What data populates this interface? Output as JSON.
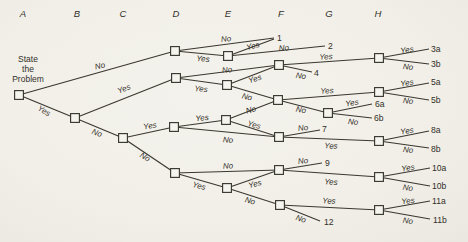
{
  "meta": {
    "bg": "#f1efe9",
    "ink": "#3a372f",
    "text_color": "#322f28",
    "node_fill": "#f6f4ee",
    "line_width": 1.15,
    "node_size": 8.8
  },
  "headers": {
    "y": 13,
    "items": [
      {
        "t": "A",
        "x": 23
      },
      {
        "t": "B",
        "x": 77
      },
      {
        "t": "C",
        "x": 123
      },
      {
        "t": "D",
        "x": 176
      },
      {
        "t": "E",
        "x": 228
      },
      {
        "t": "F",
        "x": 281
      },
      {
        "t": "G",
        "x": 329
      },
      {
        "t": "H",
        "x": 378
      }
    ]
  },
  "problem": {
    "lines": [
      "State",
      "the",
      "Problem"
    ],
    "x": 28,
    "y": 58.5,
    "lh": 10.3
  },
  "nodes": [
    {
      "id": "A",
      "x": 19,
      "y": 95
    },
    {
      "id": "B",
      "x": 75,
      "y": 118
    },
    {
      "id": "C",
      "x": 123,
      "y": 138
    },
    {
      "id": "D1",
      "x": 175,
      "y": 51
    },
    {
      "id": "D2",
      "x": 176,
      "y": 78
    },
    {
      "id": "D4",
      "x": 174,
      "y": 127
    },
    {
      "id": "D5",
      "x": 175,
      "y": 173
    },
    {
      "id": "E1",
      "x": 228,
      "y": 56
    },
    {
      "id": "E2",
      "x": 227,
      "y": 85
    },
    {
      "id": "E4",
      "x": 226,
      "y": 120
    },
    {
      "id": "E5",
      "x": 227,
      "y": 188
    },
    {
      "id": "F3",
      "x": 279,
      "y": 65
    },
    {
      "id": "F6",
      "x": 278,
      "y": 100
    },
    {
      "id": "F7",
      "x": 279,
      "y": 137
    },
    {
      "id": "F9",
      "x": 279,
      "y": 170
    },
    {
      "id": "F11",
      "x": 280,
      "y": 205
    },
    {
      "id": "G6",
      "x": 328,
      "y": 113
    },
    {
      "id": "H3",
      "x": 379,
      "y": 58
    },
    {
      "id": "H5",
      "x": 379,
      "y": 92
    },
    {
      "id": "H8",
      "x": 379,
      "y": 141
    },
    {
      "id": "H10",
      "x": 379,
      "y": 177
    },
    {
      "id": "H11",
      "x": 379,
      "y": 210
    }
  ],
  "edges": [
    {
      "from": "A",
      "to": "D1",
      "label": "No",
      "lx": 100,
      "ly": 66,
      "rot": -13
    },
    {
      "from": "A",
      "to": "B",
      "label": "Yes",
      "lx": 44,
      "ly": 111,
      "rot": 30
    },
    {
      "from": "B",
      "to": "D2",
      "label": "Yes",
      "lx": 124,
      "ly": 89,
      "rot": -22
    },
    {
      "from": "B",
      "to": "C",
      "label": "No",
      "lx": 97,
      "ly": 133,
      "rot": 22
    },
    {
      "from": "C",
      "to": "D4",
      "label": "Yes",
      "lx": 150,
      "ly": 126,
      "rot": -10
    },
    {
      "from": "C",
      "to": "D5",
      "label": "No",
      "lx": 145,
      "ly": 157,
      "rot": 32
    },
    {
      "from": "D1",
      "pt": [
        274,
        38
      ],
      "label": "No",
      "lx": 226,
      "ly": 39,
      "rot": -6
    },
    {
      "from": "D1",
      "to": "E1",
      "label": "Yes",
      "lx": 203,
      "ly": 59,
      "rot": 4
    },
    {
      "from": "E1",
      "pt": [
        274,
        39
      ],
      "label": "Yes",
      "lx": 253,
      "ly": 46,
      "rot": -16
    },
    {
      "from": "E1",
      "pt": [
        325,
        46
      ],
      "label": "No",
      "lx": 284,
      "ly": 48,
      "rot": -5
    },
    {
      "from": "D2",
      "to": "F3",
      "label": "No",
      "lx": 227,
      "ly": 70,
      "rot": -6
    },
    {
      "from": "D2",
      "to": "E2",
      "label": "Yes",
      "lx": 201,
      "ly": 89,
      "rot": 5
    },
    {
      "from": "E2",
      "to": "F3",
      "label": "Yes",
      "lx": 255,
      "ly": 79,
      "rot": -17
    },
    {
      "from": "E2",
      "to": "F6",
      "label": "No",
      "lx": 247,
      "ly": 97,
      "rot": 14
    },
    {
      "from": "F3",
      "to": "H3",
      "label": "Yes",
      "lx": 326,
      "ly": 57,
      "rot": -3
    },
    {
      "from": "F3",
      "pt": [
        312,
        72
      ],
      "label": "No",
      "lx": 301,
      "ly": 76,
      "rot": 9
    },
    {
      "from": "H3",
      "pt": [
        429,
        49
      ],
      "label": "Yes",
      "lx": 407,
      "ly": 50,
      "rot": -8
    },
    {
      "from": "H3",
      "pt": [
        429,
        64
      ],
      "label": "No",
      "lx": 408,
      "ly": 67,
      "rot": 5
    },
    {
      "from": "E4",
      "to": "F6",
      "label": "No",
      "lx": 251,
      "ly": 110,
      "rot": -16
    },
    {
      "from": "F6",
      "to": "H5",
      "label": "Yes",
      "lx": 327,
      "ly": 91,
      "rot": -3
    },
    {
      "from": "F6",
      "to": "G6",
      "label": "No",
      "lx": 301,
      "ly": 110,
      "rot": 10
    },
    {
      "from": "G6",
      "pt": [
        372,
        104
      ],
      "label": "Yes",
      "lx": 352,
      "ly": 103,
      "rot": -8
    },
    {
      "from": "G6",
      "pt": [
        372,
        118
      ],
      "label": "No",
      "lx": 353,
      "ly": 122,
      "rot": 6
    },
    {
      "from": "H5",
      "pt": [
        429,
        83
      ],
      "label": "Yes",
      "lx": 407,
      "ly": 83,
      "rot": -8
    },
    {
      "from": "H5",
      "pt": [
        429,
        100
      ],
      "label": "No",
      "lx": 408,
      "ly": 101,
      "rot": 6
    },
    {
      "from": "D4",
      "to": "E4",
      "label": "Yes",
      "lx": 202,
      "ly": 118,
      "rot": -6
    },
    {
      "from": "D4",
      "to": "F7",
      "label": "No",
      "lx": 228,
      "ly": 140,
      "rot": 4
    },
    {
      "from": "E4",
      "to": "F7",
      "label": "Yes",
      "lx": 254,
      "ly": 125,
      "rot": 14
    },
    {
      "from": "F7",
      "pt": [
        320,
        130
      ],
      "label": "No",
      "lx": 303,
      "ly": 128,
      "rot": -7
    },
    {
      "from": "F7",
      "to": "H8",
      "label": "Yes",
      "lx": 331,
      "ly": 146,
      "rot": 2
    },
    {
      "from": "H8",
      "pt": [
        429,
        131
      ],
      "label": "Yes",
      "lx": 407,
      "ly": 131,
      "rot": -9
    },
    {
      "from": "H8",
      "pt": [
        429,
        148
      ],
      "label": "No",
      "lx": 408,
      "ly": 150,
      "rot": 6
    },
    {
      "from": "D5",
      "to": "F9",
      "label": "No",
      "lx": 228,
      "ly": 166,
      "rot": -2
    },
    {
      "from": "D5",
      "to": "E5",
      "label": "Yes",
      "lx": 199,
      "ly": 186,
      "rot": 15
    },
    {
      "from": "E5",
      "to": "F9",
      "label": "Yes",
      "lx": 255,
      "ly": 184,
      "rot": -16
    },
    {
      "from": "E5",
      "to": "F11",
      "label": "No",
      "lx": 250,
      "ly": 201,
      "rot": 15
    },
    {
      "from": "F9",
      "pt": [
        322,
        163
      ],
      "label": "No",
      "lx": 303,
      "ly": 161,
      "rot": -7
    },
    {
      "from": "F9",
      "to": "H10",
      "label": "Yes",
      "lx": 331,
      "ly": 182,
      "rot": 3
    },
    {
      "from": "H10",
      "pt": [
        430,
        168
      ],
      "label": "Yes",
      "lx": 408,
      "ly": 168,
      "rot": -8
    },
    {
      "from": "H10",
      "pt": [
        430,
        186
      ],
      "label": "No",
      "lx": 408,
      "ly": 188,
      "rot": 7
    },
    {
      "from": "F11",
      "to": "H11",
      "label": "Yes",
      "lx": 329,
      "ly": 201,
      "rot": 2
    },
    {
      "from": "F11",
      "pt": [
        320,
        221
      ],
      "label": "No",
      "lx": 301,
      "ly": 219,
      "rot": 18
    },
    {
      "from": "H11",
      "pt": [
        430,
        201
      ],
      "label": "Yes",
      "lx": 408,
      "ly": 201,
      "rot": -7
    },
    {
      "from": "H11",
      "pt": [
        430,
        219
      ],
      "label": "No",
      "lx": 408,
      "ly": 221,
      "rot": 7
    }
  ],
  "terminals": [
    {
      "t": "1",
      "x": 277,
      "y": 38
    },
    {
      "t": "2",
      "x": 328,
      "y": 46
    },
    {
      "t": "3a",
      "x": 431,
      "y": 49
    },
    {
      "t": "3b",
      "x": 431,
      "y": 64
    },
    {
      "t": "4",
      "x": 314,
      "y": 73
    },
    {
      "t": "5a",
      "x": 431,
      "y": 82
    },
    {
      "t": "5b",
      "x": 431,
      "y": 100
    },
    {
      "t": "6a",
      "x": 375,
      "y": 104
    },
    {
      "t": "6b",
      "x": 374,
      "y": 118
    },
    {
      "t": "7",
      "x": 322,
      "y": 129
    },
    {
      "t": "8a",
      "x": 431,
      "y": 130
    },
    {
      "t": "8b",
      "x": 431,
      "y": 149
    },
    {
      "t": "9",
      "x": 325,
      "y": 163
    },
    {
      "t": "10a",
      "x": 432,
      "y": 168
    },
    {
      "t": "10b",
      "x": 432,
      "y": 186
    },
    {
      "t": "11a",
      "x": 432,
      "y": 201
    },
    {
      "t": "11b",
      "x": 433,
      "y": 220
    },
    {
      "t": "12",
      "x": 324,
      "y": 222
    }
  ]
}
